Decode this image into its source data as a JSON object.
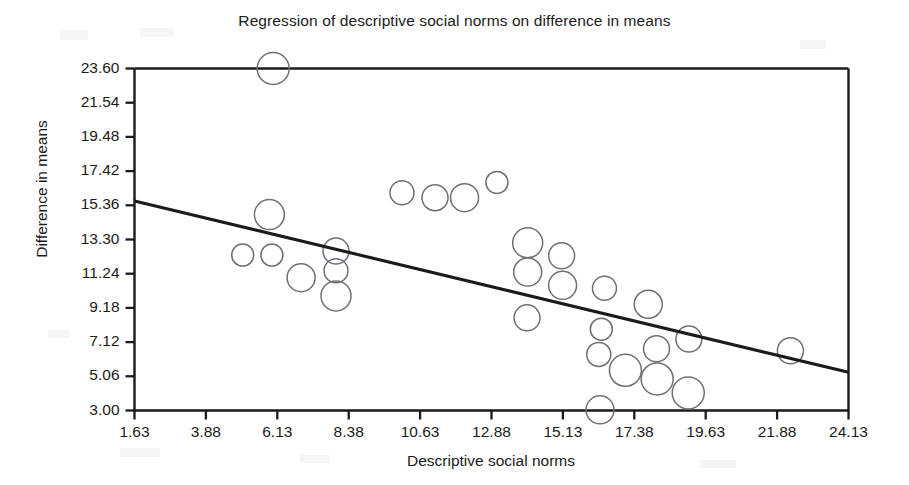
{
  "chart_data": {
    "type": "scatter",
    "title": "Regression of descriptive social norms on difference in means",
    "xlabel": "Descriptive social norms",
    "ylabel": "Difference in means",
    "grid": false,
    "legend": "none",
    "marker_style": "hollow-circle-variable-size",
    "xlim": [
      1.63,
      24.13
    ],
    "ylim": [
      3.0,
      23.6
    ],
    "xticks": [
      "1.63",
      "3.88",
      "6.13",
      "8.38",
      "10.63",
      "12.88",
      "15.13",
      "17.38",
      "19.63",
      "21.88",
      "24.13"
    ],
    "yticks": [
      "3.00",
      "5.06",
      "7.12",
      "9.18",
      "11.24",
      "13.30",
      "15.36",
      "17.42",
      "19.48",
      "21.54",
      "23.60"
    ],
    "xtick_values": [
      1.63,
      3.88,
      6.13,
      8.38,
      10.63,
      12.88,
      15.13,
      17.38,
      19.63,
      21.88,
      24.13
    ],
    "ytick_values": [
      3.0,
      5.06,
      7.12,
      9.18,
      11.24,
      13.3,
      15.36,
      17.42,
      19.48,
      21.54,
      23.6
    ],
    "series": [
      {
        "name": "observations",
        "points": [
          {
            "x": 6.0,
            "y": 23.6,
            "r": 16
          },
          {
            "x": 5.88,
            "y": 14.8,
            "r": 15
          },
          {
            "x": 5.04,
            "y": 12.36,
            "r": 11
          },
          {
            "x": 5.96,
            "y": 12.36,
            "r": 11
          },
          {
            "x": 6.88,
            "y": 11.0,
            "r": 14
          },
          {
            "x": 7.98,
            "y": 12.6,
            "r": 13
          },
          {
            "x": 7.98,
            "y": 11.42,
            "r": 12
          },
          {
            "x": 7.98,
            "y": 9.9,
            "r": 15
          },
          {
            "x": 10.06,
            "y": 16.12,
            "r": 12
          },
          {
            "x": 11.1,
            "y": 15.82,
            "r": 13
          },
          {
            "x": 13.05,
            "y": 16.74,
            "r": 11
          },
          {
            "x": 12.03,
            "y": 15.82,
            "r": 14
          },
          {
            "x": 14.02,
            "y": 13.1,
            "r": 15
          },
          {
            "x": 15.09,
            "y": 12.32,
            "r": 13
          },
          {
            "x": 14.02,
            "y": 11.34,
            "r": 14
          },
          {
            "x": 15.12,
            "y": 10.54,
            "r": 14
          },
          {
            "x": 16.44,
            "y": 10.36,
            "r": 12
          },
          {
            "x": 14.0,
            "y": 8.58,
            "r": 13
          },
          {
            "x": 16.34,
            "y": 7.9,
            "r": 11
          },
          {
            "x": 17.82,
            "y": 9.4,
            "r": 14
          },
          {
            "x": 16.26,
            "y": 6.38,
            "r": 12
          },
          {
            "x": 17.1,
            "y": 5.42,
            "r": 16
          },
          {
            "x": 18.08,
            "y": 6.72,
            "r": 13
          },
          {
            "x": 18.1,
            "y": 4.9,
            "r": 16
          },
          {
            "x": 19.1,
            "y": 7.3,
            "r": 13
          },
          {
            "x": 19.08,
            "y": 4.06,
            "r": 16
          },
          {
            "x": 16.3,
            "y": 3.04,
            "r": 14
          },
          {
            "x": 22.3,
            "y": 6.6,
            "r": 13
          }
        ]
      }
    ],
    "regression_line": {
      "x_start": 1.63,
      "y_start": 15.62,
      "x_end": 24.13,
      "y_end": 5.3,
      "slope": -0.459,
      "intercept": 16.37
    }
  }
}
